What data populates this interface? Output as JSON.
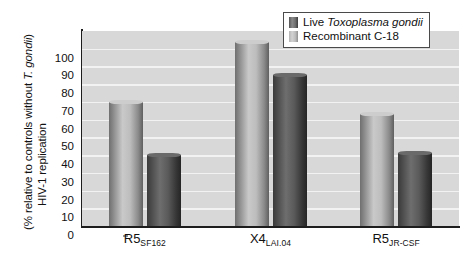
{
  "chart_data": {
    "type": "bar",
    "title": "",
    "xlabel": "",
    "ylabel_line1": "HIV-1 replication",
    "ylabel_line2_prefix": "(% relative to controls without ",
    "ylabel_line2_italic": "T. gondii",
    "ylabel_line2_suffix": ")",
    "categories": [
      "R5 SF162",
      "X4 LAI.04",
      "R5 JR-CSF"
    ],
    "category_labels": [
      {
        "base": "R5",
        "sub": "SF162"
      },
      {
        "base": "X4",
        "sub": "LAI.04"
      },
      {
        "base": "R5",
        "sub": "JR-CSF"
      }
    ],
    "series": [
      {
        "name": "Live Toxoplasma gondii",
        "values": [
          70,
          104,
          63
        ]
      },
      {
        "name": "Recombinant C-18",
        "values": [
          40,
          85,
          41
        ]
      }
    ],
    "ylim": [
      0,
      110
    ],
    "yticks": [
      0,
      10,
      20,
      30,
      40,
      50,
      60,
      70,
      80,
      90,
      100
    ],
    "ytick_labels": [
      "0",
      "10",
      "20",
      "30",
      "40",
      "50",
      "60",
      "70",
      "80",
      "90",
      "100"
    ],
    "grid": true,
    "grid_color": "#f2f2f2",
    "plot_background": "#d8d8d8",
    "legend_position": "top-right"
  },
  "legend": {
    "items": [
      {
        "label_prefix": "Live ",
        "label_italic": "Toxoplasma gondii",
        "swatch": "live-swatch"
      },
      {
        "label_prefix": "Recombinant C-18",
        "label_italic": "",
        "swatch": "recombinant-swatch"
      }
    ]
  }
}
